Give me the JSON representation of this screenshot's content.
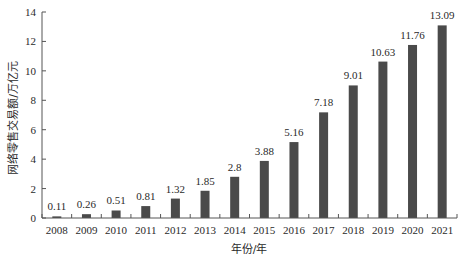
{
  "chart_data": {
    "type": "bar",
    "title": "",
    "xlabel": "年份/年",
    "ylabel": "网络零售交易额/万亿元",
    "categories": [
      "2008",
      "2009",
      "2010",
      "2011",
      "2012",
      "2013",
      "2014",
      "2015",
      "2016",
      "2017",
      "2018",
      "2019",
      "2020",
      "2021"
    ],
    "values": [
      0.11,
      0.26,
      0.51,
      0.81,
      1.32,
      1.85,
      2.8,
      3.88,
      5.16,
      7.18,
      9.01,
      10.63,
      11.76,
      13.09
    ],
    "value_labels": [
      "0.11",
      "0.26",
      "0.51",
      "0.81",
      "1.32",
      "1.85",
      "2.8",
      "3.88",
      "5.16",
      "7.18",
      "9.01",
      "10.63",
      "11.76",
      "13.09"
    ],
    "ylim": [
      0,
      14
    ],
    "yticks": [
      0,
      2,
      4,
      6,
      8,
      10,
      12,
      14
    ],
    "grid": false,
    "legend": null,
    "bar_color": "#4a4a4a"
  }
}
